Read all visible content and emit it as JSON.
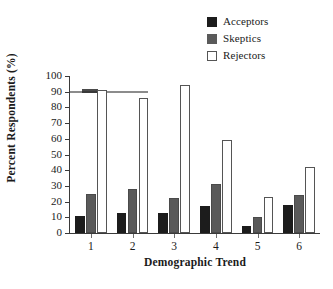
{
  "chart_data": {
    "type": "bar",
    "title": "",
    "xlabel": "Demographic Trend",
    "ylabel": "Percent Respondents (%)",
    "categories": [
      "1",
      "2",
      "3",
      "4",
      "5",
      "6"
    ],
    "series": [
      {
        "name": "Acceptors",
        "color": "#1c1c1c",
        "values": [
          11,
          13,
          13,
          17,
          4.5,
          18
        ]
      },
      {
        "name": "Skeptics",
        "color": "#5a5a5a",
        "values": [
          25,
          28,
          22,
          31.5,
          10,
          24
        ]
      },
      {
        "name": "Rejectors",
        "color": "#ffffff",
        "values": [
          91,
          86,
          94,
          59.5,
          23,
          42
        ]
      }
    ],
    "ylim": [
      0,
      100
    ],
    "yticks": [
      0,
      10,
      20,
      30,
      40,
      50,
      60,
      70,
      80,
      90,
      100
    ],
    "ytick_labels": [
      "0",
      "10",
      "20",
      "30",
      "40",
      "50",
      "60",
      "70",
      "80",
      "90",
      "100"
    ],
    "grid": false,
    "legend_position": "top-right",
    "legend": [
      {
        "label": "Acceptors",
        "swatch": "filled-black-square"
      },
      {
        "label": "Skeptics",
        "swatch": "filled-gray-square"
      },
      {
        "label": "Rejectors",
        "swatch": "open-white-square"
      }
    ],
    "annotations": [
      {
        "name": "scan-smudge-artifact",
        "value_y": 90.5,
        "text": ""
      }
    ]
  }
}
